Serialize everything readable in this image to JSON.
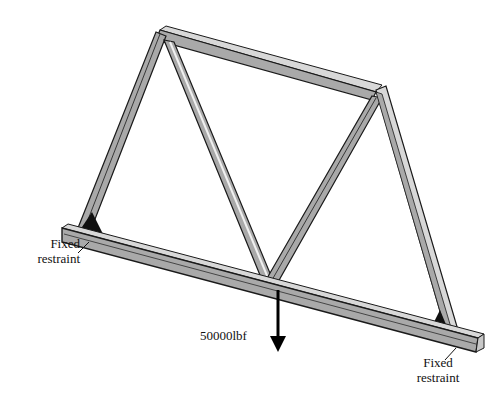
{
  "diagram": {
    "title": "",
    "labels": {
      "left_support": [
        "Fixed",
        "restraint"
      ],
      "right_support": [
        "Fixed",
        "restraint"
      ],
      "load": "50000lbf"
    },
    "colors": {
      "member_fill": "#a9a9a9",
      "member_highlight": "#d8d8d8",
      "outline": "#1a1a1a",
      "gusset": "#111111",
      "arrow": "#000000"
    }
  }
}
